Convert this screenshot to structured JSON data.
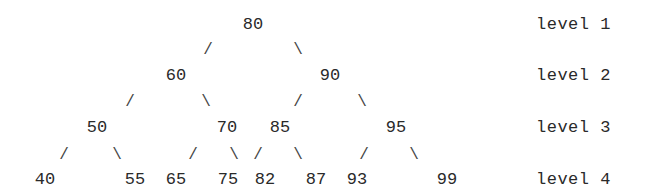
{
  "tree": {
    "levels": [
      {
        "label": "level 1",
        "y": 25,
        "nodes": [
          {
            "value": "80",
            "x": 253
          }
        ]
      },
      {
        "label": "level 2",
        "y": 76,
        "nodes": [
          {
            "value": "60",
            "x": 176
          },
          {
            "value": "90",
            "x": 330
          }
        ]
      },
      {
        "label": "level 3",
        "y": 128,
        "nodes": [
          {
            "value": "50",
            "x": 97
          },
          {
            "value": "70",
            "x": 227
          },
          {
            "value": "85",
            "x": 280
          },
          {
            "value": "95",
            "x": 396
          }
        ]
      },
      {
        "label": "level 4",
        "y": 180,
        "nodes": [
          {
            "value": "40",
            "x": 45
          },
          {
            "value": "55",
            "x": 135
          },
          {
            "value": "65",
            "x": 176
          },
          {
            "value": "75",
            "x": 228
          },
          {
            "value": "82",
            "x": 265
          },
          {
            "value": "87",
            "x": 316
          },
          {
            "value": "93",
            "x": 357
          },
          {
            "value": "99",
            "x": 447
          }
        ]
      }
    ],
    "edges": [
      {
        "glyph": "/",
        "x": 208,
        "y": 50,
        "from": "80",
        "to": "60"
      },
      {
        "glyph": "\\",
        "x": 298,
        "y": 50,
        "from": "80",
        "to": "90"
      },
      {
        "glyph": "/",
        "x": 130,
        "y": 102,
        "from": "60",
        "to": "50"
      },
      {
        "glyph": "\\",
        "x": 206,
        "y": 102,
        "from": "60",
        "to": "70"
      },
      {
        "glyph": "/",
        "x": 298,
        "y": 102,
        "from": "90",
        "to": "85"
      },
      {
        "glyph": "\\",
        "x": 362,
        "y": 102,
        "from": "90",
        "to": "95"
      },
      {
        "glyph": "/",
        "x": 64,
        "y": 155,
        "from": "50",
        "to": "40"
      },
      {
        "glyph": "\\",
        "x": 117,
        "y": 155,
        "from": "50",
        "to": "55"
      },
      {
        "glyph": "/",
        "x": 193,
        "y": 155,
        "from": "70",
        "to": "65"
      },
      {
        "glyph": "\\",
        "x": 234,
        "y": 155,
        "from": "70",
        "to": "75"
      },
      {
        "glyph": "/",
        "x": 258,
        "y": 155,
        "from": "85",
        "to": "82"
      },
      {
        "glyph": "\\",
        "x": 298,
        "y": 155,
        "from": "85",
        "to": "87"
      },
      {
        "glyph": "/",
        "x": 364,
        "y": 155,
        "from": "95",
        "to": "93"
      },
      {
        "glyph": "\\",
        "x": 414,
        "y": 155,
        "from": "95",
        "to": "99"
      }
    ]
  }
}
